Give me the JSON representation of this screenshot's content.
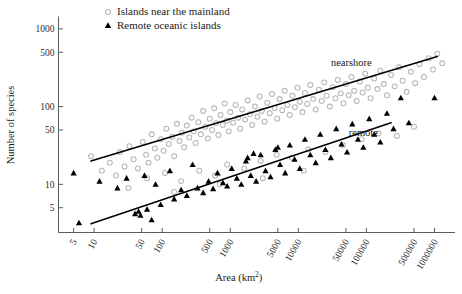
{
  "chart_data": {
    "type": "scatter",
    "title": "",
    "xlabel": "Area (km2)",
    "xlabel_base": "Area (km",
    "xlabel_sup": "2",
    "xlabel_close": ")",
    "ylabel": "Number of species",
    "xscale": "log",
    "yscale": "log",
    "xlim": [
      3,
      2000000
    ],
    "ylim": [
      2.4,
      1400
    ],
    "grid": false,
    "legend_position": "top-center",
    "xticks": [
      5,
      10,
      50,
      100,
      500,
      1000,
      5000,
      10000,
      50000,
      100000,
      500000,
      1000000
    ],
    "xtick_labels": [
      "5",
      "10",
      "50",
      "100",
      "500",
      "1000",
      "5000",
      "10000",
      "50000",
      "100000",
      "500000",
      "1000000"
    ],
    "yticks": [
      5,
      10,
      50,
      100,
      500,
      1000
    ],
    "ytick_labels": [
      "5",
      "10",
      "50",
      "100",
      "500",
      "1000"
    ],
    "annotations": [
      {
        "text": "nearshore",
        "x": 60000,
        "y": 330
      },
      {
        "text": "remote",
        "x": 90000,
        "y": 42
      }
    ],
    "series": [
      {
        "name": "Islands near the mainland",
        "marker": "open-circle",
        "color": "#b6b6b6",
        "points": [
          [
            9,
            23
          ],
          [
            13,
            15
          ],
          [
            17,
            19
          ],
          [
            21,
            13
          ],
          [
            24,
            26
          ],
          [
            28,
            17
          ],
          [
            33,
            31
          ],
          [
            38,
            21
          ],
          [
            44,
            16
          ],
          [
            52,
            35
          ],
          [
            58,
            24
          ],
          [
            63,
            19
          ],
          [
            70,
            44
          ],
          [
            78,
            29
          ],
          [
            85,
            22
          ],
          [
            95,
            38
          ],
          [
            105,
            27
          ],
          [
            115,
            52
          ],
          [
            125,
            33
          ],
          [
            140,
            41
          ],
          [
            150,
            23
          ],
          [
            165,
            60
          ],
          [
            180,
            36
          ],
          [
            195,
            46
          ],
          [
            210,
            30
          ],
          [
            230,
            57
          ],
          [
            250,
            40
          ],
          [
            270,
            72
          ],
          [
            290,
            48
          ],
          [
            310,
            34
          ],
          [
            340,
            63
          ],
          [
            370,
            44
          ],
          [
            400,
            88
          ],
          [
            430,
            55
          ],
          [
            470,
            39
          ],
          [
            500,
            70
          ],
          [
            540,
            50
          ],
          [
            580,
            95
          ],
          [
            620,
            61
          ],
          [
            670,
            43
          ],
          [
            720,
            78
          ],
          [
            780,
            58
          ],
          [
            830,
            110
          ],
          [
            890,
            66
          ],
          [
            950,
            48
          ],
          [
            1000,
            85
          ],
          [
            1100,
            62
          ],
          [
            1200,
            105
          ],
          [
            1300,
            72
          ],
          [
            1400,
            52
          ],
          [
            1500,
            92
          ],
          [
            1650,
            68
          ],
          [
            1800,
            120
          ],
          [
            1950,
            80
          ],
          [
            2100,
            58
          ],
          [
            2300,
            100
          ],
          [
            2500,
            74
          ],
          [
            2700,
            135
          ],
          [
            2900,
            88
          ],
          [
            3200,
            64
          ],
          [
            3500,
            112
          ],
          [
            3800,
            82
          ],
          [
            4100,
            145
          ],
          [
            4500,
            96
          ],
          [
            4900,
            70
          ],
          [
            5300,
            125
          ],
          [
            5800,
            90
          ],
          [
            6300,
            160
          ],
          [
            6900,
            105
          ],
          [
            7500,
            78
          ],
          [
            8200,
            138
          ],
          [
            8900,
            98
          ],
          [
            9700,
            175
          ],
          [
            10500,
            115
          ],
          [
            11500,
            85
          ],
          [
            12500,
            150
          ],
          [
            13500,
            108
          ],
          [
            15000,
            190
          ],
          [
            16500,
            125
          ],
          [
            18000,
            92
          ],
          [
            20000,
            165
          ],
          [
            22000,
            118
          ],
          [
            24000,
            205
          ],
          [
            26000,
            138
          ],
          [
            29000,
            100
          ],
          [
            32000,
            178
          ],
          [
            35000,
            128
          ],
          [
            38000,
            220
          ],
          [
            42000,
            148
          ],
          [
            46000,
            110
          ],
          [
            50000,
            195
          ],
          [
            55000,
            140
          ],
          [
            60000,
            240
          ],
          [
            66000,
            160
          ],
          [
            72000,
            118
          ],
          [
            80000,
            210
          ],
          [
            88000,
            152
          ],
          [
            96000,
            265
          ],
          [
            105000,
            175
          ],
          [
            115000,
            128
          ],
          [
            130000,
            230
          ],
          [
            145000,
            168
          ],
          [
            160000,
            290
          ],
          [
            180000,
            195
          ],
          [
            200000,
            140
          ],
          [
            230000,
            255
          ],
          [
            260000,
            182
          ],
          [
            300000,
            320
          ],
          [
            340000,
            215
          ],
          [
            390000,
            155
          ],
          [
            450000,
            280
          ],
          [
            520000,
            200
          ],
          [
            600000,
            350
          ],
          [
            700000,
            240
          ],
          [
            820000,
            420
          ],
          [
            950000,
            300
          ],
          [
            1100000,
            480
          ],
          [
            1300000,
            360
          ],
          [
            60,
            12
          ],
          [
            110,
            14
          ],
          [
            190,
            11
          ],
          [
            350,
            15
          ],
          [
            600,
            13
          ],
          [
            900,
            18
          ],
          [
            1600,
            16
          ],
          [
            2800,
            20
          ],
          [
            4800,
            24
          ],
          [
            8000,
            22
          ],
          [
            14000,
            28
          ],
          [
            25000,
            26
          ],
          [
            45000,
            32
          ],
          [
            85000,
            38
          ],
          [
            150000,
            45
          ],
          [
            280000,
            42
          ],
          [
            500000,
            55
          ],
          [
            32,
            9
          ],
          [
            150,
            8
          ],
          [
            700,
            10
          ],
          [
            3000,
            12
          ],
          [
            12000,
            15
          ]
        ]
      },
      {
        "name": "Remote oceanic islands",
        "marker": "filled-triangle",
        "color": "#000000",
        "points": [
          [
            5,
            14
          ],
          [
            6,
            3.2
          ],
          [
            12,
            11
          ],
          [
            22,
            9
          ],
          [
            30,
            12
          ],
          [
            40,
            4.2
          ],
          [
            45,
            4.5
          ],
          [
            48,
            4.0
          ],
          [
            55,
            13
          ],
          [
            60,
            4.8
          ],
          [
            80,
            10
          ],
          [
            95,
            5.5
          ],
          [
            130,
            15
          ],
          [
            150,
            6.5
          ],
          [
            190,
            8.5
          ],
          [
            230,
            7.2
          ],
          [
            280,
            18
          ],
          [
            330,
            9.0
          ],
          [
            400,
            7.8
          ],
          [
            480,
            11
          ],
          [
            560,
            8.8
          ],
          [
            650,
            14
          ],
          [
            780,
            10.5
          ],
          [
            900,
            9.5
          ],
          [
            1050,
            16
          ],
          [
            1250,
            12
          ],
          [
            1450,
            10
          ],
          [
            1700,
            20
          ],
          [
            2000,
            13
          ],
          [
            2400,
            11
          ],
          [
            2800,
            24
          ],
          [
            3300,
            15
          ],
          [
            3900,
            12.5
          ],
          [
            4600,
            28
          ],
          [
            5400,
            18
          ],
          [
            6400,
            14
          ],
          [
            7500,
            32
          ],
          [
            8800,
            21
          ],
          [
            10500,
            16
          ],
          [
            12500,
            38
          ],
          [
            15000,
            24
          ],
          [
            18000,
            19
          ],
          [
            21000,
            44
          ],
          [
            25000,
            28
          ],
          [
            30000,
            22
          ],
          [
            36000,
            52
          ],
          [
            43000,
            33
          ],
          [
            52000,
            26
          ],
          [
            62000,
            60
          ],
          [
            75000,
            38
          ],
          [
            90000,
            30
          ],
          [
            110000,
            70
          ],
          [
            130000,
            44
          ],
          [
            160000,
            35
          ],
          [
            200000,
            82
          ],
          [
            250000,
            52
          ],
          [
            320000,
            130
          ],
          [
            420000,
            62
          ],
          [
            1000000,
            130
          ],
          [
            70,
            3.5
          ],
          [
            2200,
            25
          ],
          [
            5000,
            30
          ],
          [
            1800,
            22
          ]
        ]
      }
    ],
    "trend_lines": [
      {
        "name": "nearshore",
        "x_start": 9,
        "y_start": 20,
        "x_end": 1100000,
        "y_end": 440
      },
      {
        "name": "remote",
        "x_start": 9,
        "y_start": 3.1,
        "x_end": 230000,
        "y_end": 62
      }
    ]
  },
  "legend": {
    "items": [
      {
        "label": "Islands near the mainland",
        "marker": "open-circle"
      },
      {
        "label": "Remote oceanic islands",
        "marker": "filled-triangle"
      }
    ]
  }
}
